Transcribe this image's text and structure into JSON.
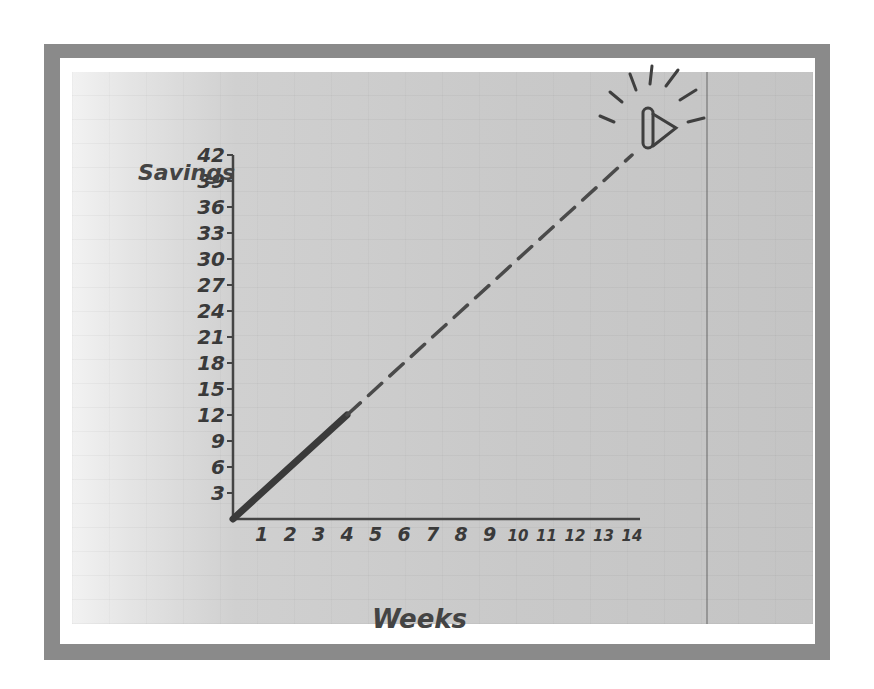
{
  "chart_data": {
    "type": "line",
    "title": "",
    "xlabel": "Weeks",
    "ylabel": "Savings",
    "x": [
      0,
      1,
      2,
      3,
      4,
      5,
      6,
      7,
      8,
      9,
      10,
      11,
      12,
      13,
      14
    ],
    "x_ticks": [
      "1",
      "2",
      "3",
      "4",
      "5",
      "6",
      "7",
      "8",
      "9",
      "10",
      "11",
      "12",
      "13",
      "14"
    ],
    "y_ticks": [
      "3",
      "6",
      "9",
      "12",
      "15",
      "18",
      "21",
      "24",
      "27",
      "30",
      "33",
      "36",
      "39",
      "42"
    ],
    "xlim": [
      0,
      14
    ],
    "ylim": [
      0,
      42
    ],
    "grid": false,
    "legend": null,
    "series": [
      {
        "name": "Actual savings",
        "style": "solid",
        "points": [
          [
            0,
            0
          ],
          [
            1,
            3
          ],
          [
            2,
            6
          ],
          [
            3,
            9
          ],
          [
            4,
            12
          ]
        ]
      },
      {
        "name": "Projected savings",
        "style": "dashed",
        "points": [
          [
            4,
            12
          ],
          [
            5,
            15
          ],
          [
            6,
            18
          ],
          [
            7,
            21
          ],
          [
            8,
            24
          ],
          [
            9,
            27
          ],
          [
            10,
            30
          ],
          [
            11,
            33
          ],
          [
            12,
            36
          ],
          [
            13,
            39
          ],
          [
            14,
            42
          ]
        ]
      }
    ],
    "annotations": [
      {
        "type": "icon",
        "name": "ringing-bell-goal",
        "at": [
          14,
          42
        ]
      }
    ]
  },
  "labels": {
    "y_axis_title": "Savings",
    "x_axis_title": "Weeks"
  },
  "colors": {
    "frame": "#8a8a8a",
    "mat": "#ffffff",
    "paper": "#c9c9c9",
    "ink": "#3a3a3a"
  }
}
